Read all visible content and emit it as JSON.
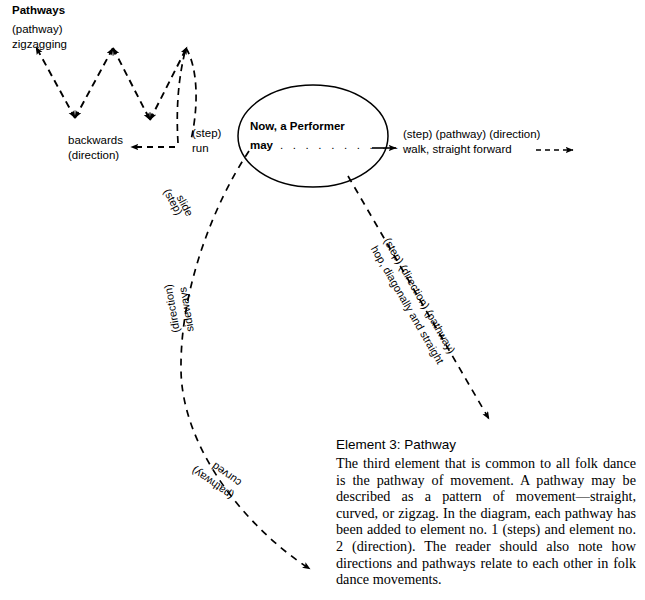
{
  "figure": {
    "heading": "Pathways",
    "center_node": {
      "line1": "Now, a Performer",
      "line2": "may",
      "dots": ". . . . . . . . . . . ."
    },
    "branches": [
      {
        "id": "zigzag-backwards-run",
        "pathway_label": "(pathway)",
        "pathway_value": "zigzagging",
        "direction_label": "backwards",
        "direction_note": "(direction)",
        "step_label": "(step)",
        "step_value": "run"
      },
      {
        "id": "walk-straight-forward",
        "qualifiers": "(step) (pathway) (direction)",
        "value": "walk, straight forward",
        "trailing_dashes": "----"
      },
      {
        "id": "hop-diagonally-straight",
        "qualifiers": "(step) (direction) (pathway)",
        "value": "hop, diagonally and straight"
      },
      {
        "id": "slide-sideways-curved",
        "step_label": "(step)",
        "step_value": "slide",
        "direction_value": "sideways",
        "direction_label": "(direction)",
        "pathway_value": "curved",
        "pathway_label": "(pathway)"
      }
    ]
  },
  "article": {
    "title": "Element 3: Pathway",
    "paragraph": "The third element that is common to all folk dance is the pathway of movement. A pathway may be described as a pattern of movement—straight, curved, or zigzag. In the diagram, each pathway has been added to element no. 1 (steps) and element no. 2 (direction). The reader should also note how directions and pathways relate to each other in folk dance movements."
  },
  "colors": {
    "ink": "#000000",
    "background": "#ffffff"
  }
}
